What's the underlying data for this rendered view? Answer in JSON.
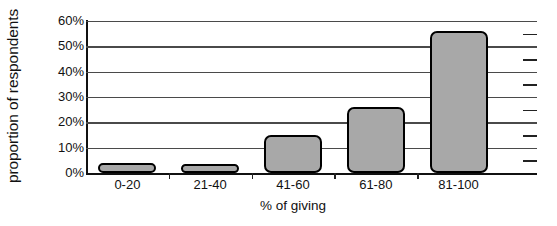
{
  "chart_data": {
    "type": "bar",
    "title": "",
    "subtitle": "",
    "xlabel": "% of giving",
    "ylabel": "proportion of respondents",
    "categories": [
      "0-20",
      "21-40",
      "41-60",
      "61-80",
      "81-100"
    ],
    "values": [
      4,
      2,
      15,
      26,
      56
    ],
    "ylim": [
      0,
      60
    ],
    "ytick_values": [
      0,
      10,
      20,
      30,
      40,
      50,
      60
    ],
    "ytick_labels": [
      "0%",
      "10%",
      "20%",
      "30%",
      "40%",
      "50%",
      "60%"
    ],
    "grid": true,
    "grid_axis": "y",
    "legend": false,
    "legend_position": "none",
    "series": [
      {
        "name": "proportion of respondents",
        "values": [
          4,
          2,
          15,
          26,
          56
        ]
      }
    ],
    "annotations": [],
    "colors": {
      "bar_fill": "#a8a8a8",
      "bar_edge": "#000000",
      "gridline": "#4a4a4a",
      "axis": "#111111",
      "background": "#ffffff",
      "text": "#111111"
    }
  }
}
